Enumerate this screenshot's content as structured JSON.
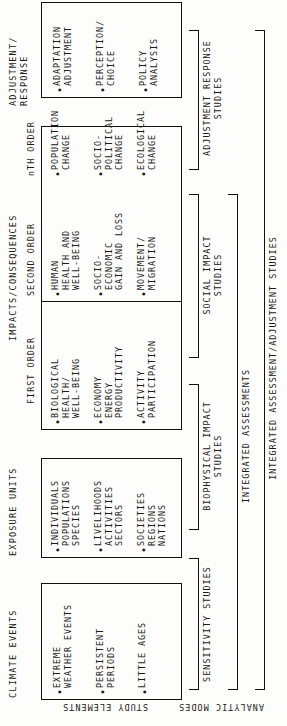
{
  "figure": {
    "orientation": "rotated-90-ccw",
    "columns": [
      {
        "id": "climate-events",
        "header": "CLIMATE EVENTS",
        "items": [
          "EXTREME\nWEATHER EVENTS",
          "PERSISTENT\nPERIODS",
          "LITTLE AGES"
        ]
      },
      {
        "id": "exposure-units",
        "header": "EXPOSURE UNITS",
        "items": [
          "INDIVIDUALS\nPOPULATIONS\nSPECIES",
          "LIVELIHOODS\nACTIVITIES\nSECTORS",
          "SOCIETIES\nREGIONS\nNATIONS"
        ]
      },
      {
        "id": "impacts-consequences",
        "header": "IMPACTS/CONSEQUENCES",
        "subheaders": [
          "FIRST ORDER",
          "SECOND ORDER",
          "nTH ORDER"
        ],
        "first_order": [
          "BIOLOGICAL\nHEALTH/\nWELL-BEING",
          "ECONOMY\nENERGY\nPRODUCTIVITY",
          "ACTIVITY\nPARTICIPATION"
        ],
        "second_order": [
          "HUMAN\nHEALTH AND\nWELL-BEING",
          "SOCIO-\nECONOMIC\nGAIN AND LOSS",
          "MOVEMENT/\nMIGRATION"
        ],
        "nth_order": [
          "POPULATION\nCHANGE",
          "SOCIO-\nPOLITICAL\nCHANGE",
          "ECOLOGICAL\nCHANGE"
        ]
      },
      {
        "id": "adjustment-response",
        "header": "ADJUSTMENT/\nRESPONSE",
        "items": [
          "ADAPTATION\nADJUSTMENT",
          "PERCEPTION/\nCHOICE",
          "POLICY\nANALYSIS"
        ]
      }
    ],
    "analytic_modes": [
      {
        "id": "sensitivity-studies",
        "label": "SENSITIVITY STUDIES"
      },
      {
        "id": "biophysical-impact-studies",
        "label": "BIOPHYSICAL IMPACT\nSTUDIES"
      },
      {
        "id": "social-impact-studies",
        "label": "SOCIAL IMPACT\nSTUDIES"
      },
      {
        "id": "adjustment-response-studies",
        "label": "ADJUSTMENT RESPONSE\nSTUDIES"
      },
      {
        "id": "integrated-assessments",
        "label": "INTEGRATED ASSESSMENTS"
      },
      {
        "id": "integrated-assessment-adjustment-studies",
        "label": "INTEGRATED ASSESSMENT/ADJUSTMENT STUDIES"
      }
    ],
    "edge_labels": {
      "study_elements": "STUDY ELEMENTS",
      "analytic_modes": "ANALYTIC MODES"
    },
    "colors": {
      "ink": "#111111",
      "paper": "#fdfdfb"
    }
  }
}
